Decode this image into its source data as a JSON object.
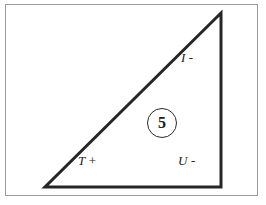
{
  "figure": {
    "background_color": "#ffffff",
    "frame": {
      "name": "figure-border",
      "color": "#9a9a9a",
      "x": 5,
      "y": 4,
      "width": 253,
      "height": 192
    },
    "shape": {
      "type": "right-triangle",
      "stroke_color": "#262626",
      "stroke_width": 3,
      "fill": "none",
      "vertices": [
        {
          "name": "apex",
          "x": 221,
          "y": 13
        },
        {
          "name": "bottom-left",
          "x": 45,
          "y": 187
        },
        {
          "name": "bottom-right",
          "x": 221,
          "y": 187
        }
      ]
    },
    "edge_labels": [
      {
        "name": "hypotenuse-label",
        "letter": "I",
        "sign": "-",
        "x": 181,
        "y": 51
      },
      {
        "name": "base-label",
        "letter": "T",
        "sign": "+",
        "x": 78,
        "y": 154
      },
      {
        "name": "right-leg-label",
        "letter": "U",
        "sign": "-",
        "x": 178,
        "y": 154
      }
    ],
    "face_marker": {
      "name": "face-number",
      "value": "5",
      "shape": "circle",
      "x": 147,
      "y": 108,
      "diameter": 30,
      "stroke_color": "#2b2b2b",
      "text_color": "#1a1a1a"
    }
  }
}
